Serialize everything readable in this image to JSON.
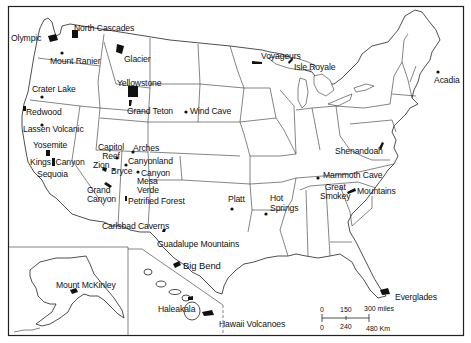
{
  "map": {
    "title": "U.S. National Parks",
    "colors": {
      "ink": "#111111",
      "background": "#ffffff"
    },
    "parks": [
      {
        "id": "olympic",
        "label": "Olympic",
        "x": 11,
        "y": 34
      },
      {
        "id": "north-cascades",
        "label": "North Cascades",
        "x": 73,
        "y": 24
      },
      {
        "id": "mount-rainier",
        "label": "Mount Ranier",
        "x": 50,
        "y": 57
      },
      {
        "id": "glacier",
        "label": "Glacier",
        "x": 124,
        "y": 54
      },
      {
        "id": "yellowstone",
        "label": "Yellowstone",
        "x": 117,
        "y": 79
      },
      {
        "id": "crater-lake",
        "label": "Crater Lake",
        "x": 32,
        "y": 85
      },
      {
        "id": "grand-teton",
        "label": "Grand Teton",
        "x": 126,
        "y": 107
      },
      {
        "id": "wind-cave",
        "label": "Wind Cave",
        "x": 189,
        "y": 107
      },
      {
        "id": "redwood",
        "label": "Redwood",
        "x": 25,
        "y": 109
      },
      {
        "id": "lassen-volcanic",
        "label": "Lassen Volcanic",
        "x": 23,
        "y": 125
      },
      {
        "id": "yosemite",
        "label": "Yosemite",
        "x": 33,
        "y": 141
      },
      {
        "id": "capitol-reef",
        "label": "Capitol\nReef",
        "x": 97,
        "y": 143
      },
      {
        "id": "arches",
        "label": "Arches",
        "x": 132,
        "y": 144
      },
      {
        "id": "kings-canyon",
        "label": "Kings  Canyon",
        "x": 30,
        "y": 158
      },
      {
        "id": "zion",
        "label": "Zion",
        "x": 92,
        "y": 160
      },
      {
        "id": "canyonland",
        "label": "Canyonland",
        "x": 128,
        "y": 157
      },
      {
        "id": "bryce",
        "label": "Bryce",
        "x": 110,
        "y": 167
      },
      {
        "id": "sequoia",
        "label": "Sequoia",
        "x": 37,
        "y": 170
      },
      {
        "id": "canyon-de-chelly",
        "label": "Canyon",
        "x": 138,
        "y": 169
      },
      {
        "id": "mesa-verde",
        "label": "Mesa\nVerde",
        "x": 137,
        "y": 177
      },
      {
        "id": "grand-canyon",
        "label": "Grand\nCanyon",
        "x": 86,
        "y": 186
      },
      {
        "id": "petrified-forest",
        "label": "Petrified Forest",
        "x": 128,
        "y": 196
      },
      {
        "id": "platt",
        "label": "Platt",
        "x": 228,
        "y": 195
      },
      {
        "id": "hot-springs",
        "label": "Hot\nSprings",
        "x": 270,
        "y": 193
      },
      {
        "id": "shenandoah",
        "label": "Shenandoah",
        "x": 335,
        "y": 147
      },
      {
        "id": "mammoth-cave",
        "label": "Mammoth Cave",
        "x": 324,
        "y": 165
      },
      {
        "id": "great-smokey",
        "label": "Great\nSmokey",
        "x": 319,
        "y": 180
      },
      {
        "id": "mountains",
        "label": "Mountains",
        "x": 356,
        "y": 185
      },
      {
        "id": "voyageurs",
        "label": "Voyageurs",
        "x": 262,
        "y": 53
      },
      {
        "id": "isle-royale",
        "label": "Isle Royale",
        "x": 294,
        "y": 64
      },
      {
        "id": "acadia",
        "label": "Acadia",
        "x": 434,
        "y": 76
      },
      {
        "id": "carlsbad-caverns",
        "label": "Carlsbad Caverns",
        "x": 102,
        "y": 222
      },
      {
        "id": "guadalupe-mountains",
        "label": "Guadalupe Mountains",
        "x": 157,
        "y": 241
      },
      {
        "id": "big-bend",
        "label": "Big Bend",
        "x": 182,
        "y": 260
      },
      {
        "id": "everglades",
        "label": "Everglades",
        "x": 394,
        "y": 292
      },
      {
        "id": "mount-mckinley",
        "label": "Mount McKinley",
        "x": 56,
        "y": 281
      },
      {
        "id": "haleakala",
        "label": "Haleakala",
        "x": 158,
        "y": 305
      },
      {
        "id": "hawaii-volcanoes",
        "label": "Hawaii Volcanoes",
        "x": 218,
        "y": 320
      }
    ],
    "scale_bar": {
      "miles": [
        "0",
        "150",
        "300 miles"
      ],
      "km": [
        "0",
        "240",
        "480 Km"
      ]
    }
  }
}
